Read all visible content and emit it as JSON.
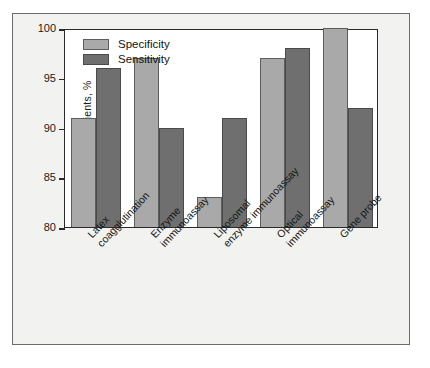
{
  "chart_data": {
    "type": "bar",
    "title": "",
    "xlabel": "",
    "ylabel": "Patients, %",
    "ylim": [
      80,
      100
    ],
    "yticks": [
      80,
      85,
      90,
      95,
      100
    ],
    "grid": false,
    "legend_position": "top-left",
    "categories": [
      "Latex coagglutination",
      "Enzyme immunoassay",
      "Liposomal enzyme immunoassay",
      "Optical immunoassay",
      "Gene probe"
    ],
    "category_lines": [
      [
        "Latex",
        "coagglutination"
      ],
      [
        "Enzyme",
        "immunoassay"
      ],
      [
        "Liposomal",
        "enzyme immunoassay"
      ],
      [
        "Optical",
        "immunoassay"
      ],
      [
        "Gene probe",
        ""
      ]
    ],
    "series": [
      {
        "name": "Specificity",
        "color": "#a9a9a9",
        "values": [
          91,
          97,
          83,
          97,
          100
        ]
      },
      {
        "name": "Sensitivity",
        "color": "#6f6f6f",
        "values": [
          96,
          90,
          91,
          98,
          92
        ]
      }
    ]
  }
}
